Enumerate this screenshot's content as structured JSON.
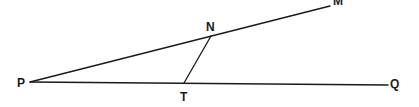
{
  "diagram": {
    "type": "geometry",
    "points": {
      "P": {
        "label": "P",
        "x": 30,
        "y": 82
      },
      "M": {
        "label": "M",
        "x": 330,
        "y": 6
      },
      "N": {
        "label": "N",
        "x": 211,
        "y": 36
      },
      "T": {
        "label": "T",
        "x": 184,
        "y": 83
      },
      "Q": {
        "label": "Q",
        "x": 388,
        "y": 85
      }
    },
    "segments": [
      {
        "from": "P",
        "to": "M",
        "name": "ray-PM"
      },
      {
        "from": "P",
        "to": "Q",
        "name": "ray-PQ"
      },
      {
        "from": "N",
        "to": "T",
        "name": "segment-NT"
      }
    ],
    "labels": {
      "P": "P",
      "M": "M",
      "N": "N",
      "T": "T",
      "Q": "Q"
    },
    "colors": {
      "line": "#1a1a1a",
      "background": "#ffffff"
    }
  }
}
